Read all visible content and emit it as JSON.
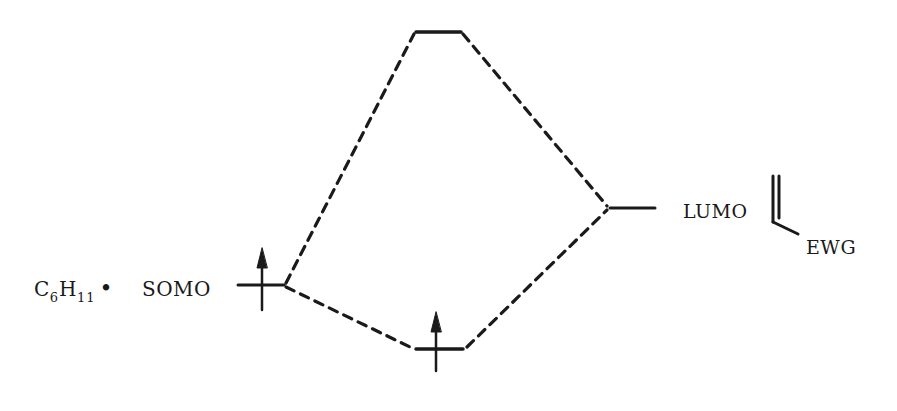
{
  "diagram": {
    "type": "molecular-orbital-interaction-diagram",
    "left_species": {
      "formula_main": "C",
      "formula_sub1": "6",
      "formula_h": "H",
      "formula_sub2": "11",
      "radical_dot": "•",
      "orbital_label": "SOMO",
      "electrons": "1 (spin up)"
    },
    "right_species": {
      "orbital_label": "LUMO",
      "substituent_label": "EWG",
      "structure": "alkene with electron-withdrawing group"
    },
    "levels": [
      {
        "name": "SOMO",
        "x1": 238,
        "x2": 287,
        "y": 285,
        "electron": "up-arrow"
      },
      {
        "name": "antibonding",
        "x1": 416,
        "x2": 461,
        "y": 32,
        "electron": "none"
      },
      {
        "name": "bonding",
        "x1": 412,
        "x2": 467,
        "y": 349,
        "electron": "up-arrow"
      },
      {
        "name": "LUMO",
        "x1": 607,
        "x2": 655,
        "y": 208,
        "electron": "none"
      }
    ],
    "correlation_lines": "dashed",
    "colors": {
      "ink": "#1a1a1a",
      "background": "#ffffff"
    }
  }
}
